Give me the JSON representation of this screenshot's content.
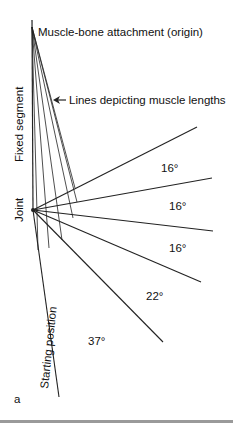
{
  "labels": {
    "origin": "Muscle-bone attachment (origin)",
    "muscle_lines": "Lines depicting muscle lengths",
    "fixed_segment": "Fixed segment",
    "joint": "Joint",
    "starting_position": "Starting position",
    "panel": "a"
  },
  "angles": [
    "16°",
    "16°",
    "16°",
    "22°",
    "37°"
  ],
  "colors": {
    "line": "#222222",
    "text": "#111111",
    "rule": "#9a9a9a"
  }
}
